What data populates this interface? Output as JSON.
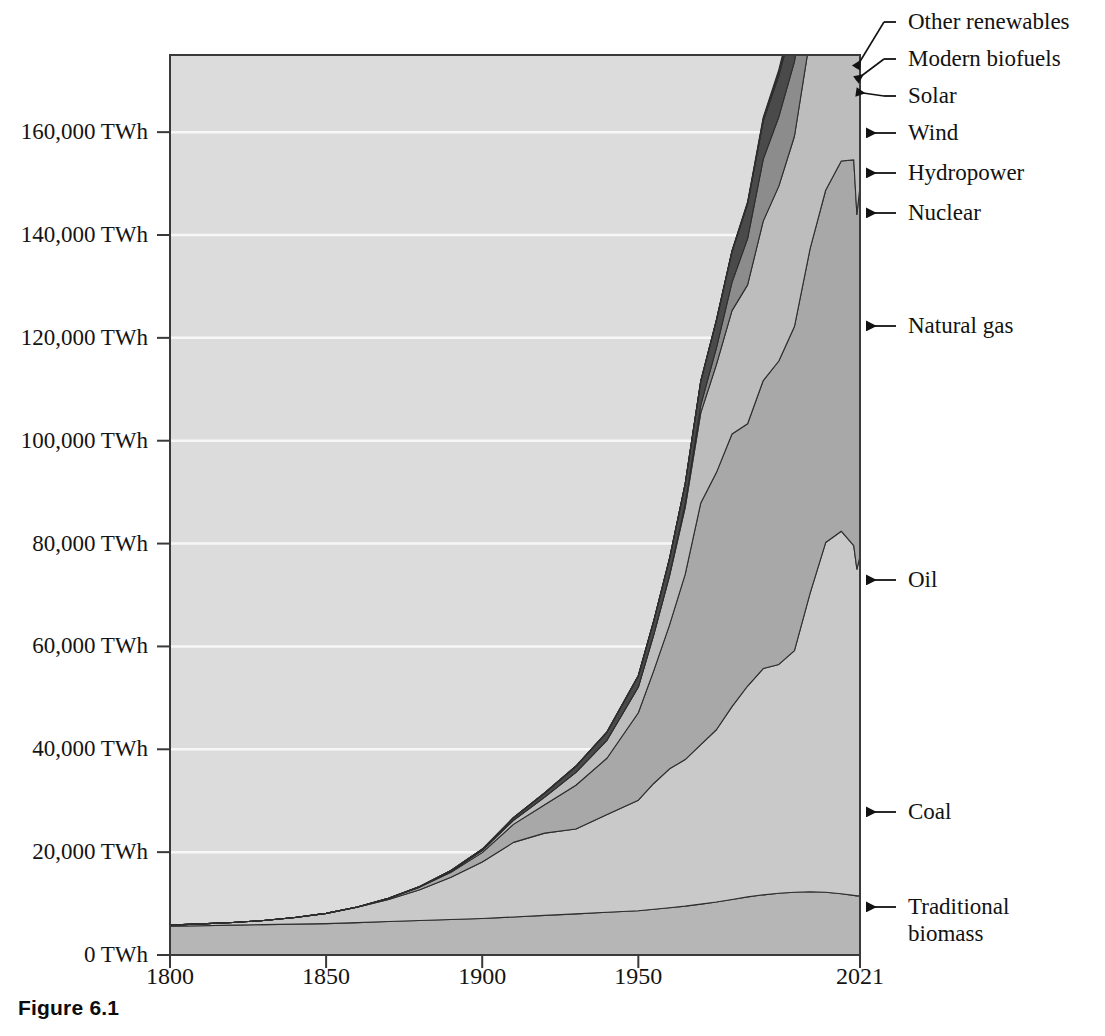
{
  "figure": {
    "caption": "Figure 6.1"
  },
  "axes": {
    "y_ticks": [
      {
        "label": "160,000 TWh",
        "value": 160000
      },
      {
        "label": "140,000 TWh",
        "value": 140000
      },
      {
        "label": "120,000 TWh",
        "value": 120000
      },
      {
        "label": "100,000 TWh",
        "value": 100000
      },
      {
        "label": "80,000 TWh",
        "value": 80000
      },
      {
        "label": "60,000 TWh",
        "value": 60000
      },
      {
        "label": "40,000 TWh",
        "value": 40000
      },
      {
        "label": "20,000 TWh",
        "value": 20000
      },
      {
        "label": "0 TWh",
        "value": 0
      }
    ],
    "x_ticks": [
      {
        "label": "1800",
        "value": 1800
      },
      {
        "label": "1850",
        "value": 1850
      },
      {
        "label": "1900",
        "value": 1900
      },
      {
        "label": "1950",
        "value": 1950
      },
      {
        "label": "2021",
        "value": 2021
      }
    ]
  },
  "series_labels": [
    {
      "name": "other-renewables",
      "text": "Other renewables"
    },
    {
      "name": "modern-biofuels",
      "text": "Modern biofuels"
    },
    {
      "name": "solar",
      "text": "Solar"
    },
    {
      "name": "wind",
      "text": "Wind"
    },
    {
      "name": "hydropower",
      "text": "Hydropower"
    },
    {
      "name": "nuclear",
      "text": "Nuclear"
    },
    {
      "name": "natural-gas",
      "text": "Natural gas"
    },
    {
      "name": "oil",
      "text": "Oil"
    },
    {
      "name": "coal",
      "text": "Coal"
    },
    {
      "name": "traditional-biomass",
      "text": "Traditional\nbiomass"
    }
  ],
  "colors": {
    "plot_background": "#dcdcdc",
    "gridline": "#f7f7f7",
    "axis": "#3a3a3a",
    "traditional_biomass": "#b6b6b6",
    "coal": "#c9c9c9",
    "oil": "#a8a8a8",
    "natural_gas": "#bdbdbd",
    "nuclear": "#8c8c8c",
    "hydropower": "#4a4a4a",
    "wind": "#6e6e6e",
    "solar": "#2a2a2a",
    "modern_biofuels": "#9a9a9a",
    "other_renewables": "#1a1a1a",
    "series_outline": "#2e2e2e",
    "text": "#121212"
  },
  "chart_data": {
    "type": "area",
    "title": "",
    "subtitle": "",
    "xlabel": "",
    "ylabel": "TWh",
    "stacked": true,
    "grid": true,
    "legend_position": "right-annotations",
    "xlim": [
      1800,
      2021
    ],
    "ylim": [
      0,
      175000
    ],
    "x": [
      1800,
      1810,
      1820,
      1830,
      1840,
      1850,
      1860,
      1870,
      1880,
      1890,
      1900,
      1910,
      1920,
      1930,
      1940,
      1950,
      1955,
      1960,
      1965,
      1970,
      1975,
      1980,
      1985,
      1990,
      1995,
      2000,
      2005,
      2010,
      2015,
      2019,
      2020,
      2021
    ],
    "series": [
      {
        "name": "Traditional biomass",
        "color": "#b6b6b6",
        "values": [
          5600,
          5700,
          5800,
          5900,
          6000,
          6100,
          6300,
          6500,
          6700,
          6900,
          7100,
          7400,
          7700,
          8000,
          8300,
          8600,
          8900,
          9200,
          9500,
          9900,
          10300,
          10800,
          11300,
          11700,
          12000,
          12200,
          12300,
          12200,
          11900,
          11600,
          11500,
          11500
        ]
      },
      {
        "name": "Coal",
        "color": "#c9c9c9",
        "values": [
          200,
          350,
          520,
          800,
          1300,
          2000,
          3000,
          4300,
          6000,
          8200,
          11000,
          14500,
          16000,
          16500,
          19000,
          21500,
          24500,
          27000,
          28500,
          31000,
          33500,
          37500,
          41000,
          44000,
          44500,
          47000,
          58000,
          68000,
          70500,
          68000,
          63500,
          66000
        ]
      },
      {
        "name": "Oil",
        "color": "#a8a8a8",
        "values": [
          0,
          0,
          0,
          0,
          0,
          0,
          50,
          200,
          500,
          1000,
          1800,
          3500,
          5500,
          8500,
          11000,
          17000,
          22000,
          28000,
          36000,
          47000,
          50000,
          53000,
          51000,
          56000,
          59000,
          63000,
          67000,
          68500,
          72000,
          75000,
          69000,
          72000
        ]
      },
      {
        "name": "Natural gas",
        "color": "#bdbdbd",
        "values": [
          0,
          0,
          0,
          0,
          0,
          0,
          0,
          30,
          80,
          200,
          400,
          800,
          1500,
          2500,
          3500,
          5000,
          7000,
          9500,
          13000,
          17500,
          21000,
          24000,
          27000,
          31000,
          34000,
          37000,
          41000,
          46000,
          49000,
          53000,
          52000,
          54000
        ]
      },
      {
        "name": "Nuclear",
        "color": "#8c8c8c",
        "values": [
          0,
          0,
          0,
          0,
          0,
          0,
          0,
          0,
          0,
          0,
          0,
          0,
          0,
          0,
          0,
          0,
          30,
          200,
          700,
          1500,
          3200,
          5500,
          9000,
          12000,
          13500,
          14500,
          15000,
          15000,
          14000,
          14500,
          14200,
          15000
        ]
      },
      {
        "name": "Hydropower",
        "color": "#4a4a4a",
        "values": [
          0,
          0,
          0,
          0,
          0,
          0,
          0,
          0,
          50,
          120,
          250,
          500,
          800,
          1200,
          1600,
          2200,
          2700,
          3200,
          3900,
          4700,
          5400,
          6000,
          6800,
          7500,
          8000,
          8700,
          9300,
          10200,
          11000,
          11700,
          11800,
          11900
        ]
      },
      {
        "name": "Wind",
        "color": "#6e6e6e",
        "values": [
          0,
          0,
          0,
          0,
          0,
          0,
          0,
          0,
          0,
          0,
          0,
          0,
          0,
          0,
          0,
          0,
          0,
          0,
          0,
          0,
          0,
          0,
          20,
          60,
          180,
          450,
          1000,
          2200,
          4100,
          6200,
          7000,
          8000
        ]
      },
      {
        "name": "Solar",
        "color": "#2a2a2a",
        "values": [
          0,
          0,
          0,
          0,
          0,
          0,
          0,
          0,
          0,
          0,
          0,
          0,
          0,
          0,
          0,
          0,
          0,
          0,
          0,
          0,
          0,
          0,
          0,
          5,
          15,
          40,
          120,
          700,
          2200,
          4200,
          5000,
          5800
        ]
      },
      {
        "name": "Modern biofuels",
        "color": "#9a9a9a",
        "values": [
          0,
          0,
          0,
          0,
          0,
          0,
          0,
          0,
          0,
          0,
          0,
          0,
          0,
          0,
          0,
          0,
          0,
          0,
          0,
          0,
          20,
          60,
          150,
          300,
          500,
          800,
          1300,
          2000,
          2600,
          3000,
          2900,
          3100
        ]
      },
      {
        "name": "Other renewables",
        "color": "#1a1a1a",
        "values": [
          0,
          0,
          0,
          0,
          0,
          0,
          0,
          0,
          0,
          0,
          0,
          0,
          0,
          0,
          0,
          0,
          0,
          0,
          0,
          30,
          60,
          110,
          200,
          320,
          450,
          620,
          850,
          1200,
          1700,
          2100,
          2200,
          2300
        ]
      }
    ],
    "total_2021": 176100
  }
}
